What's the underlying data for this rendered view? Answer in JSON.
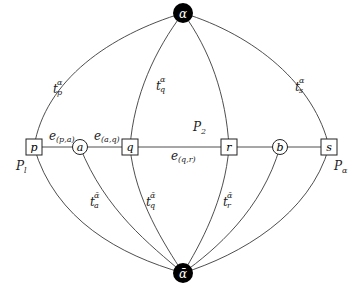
{
  "diagram": {
    "colors": {
      "line": "#3a3a3a",
      "terminal_fill": "#000000",
      "terminal_text": "#ffffff",
      "node_fill": "#ffffff"
    },
    "terminals": [
      {
        "id": "alpha",
        "label": "α",
        "shape": "filled-circle",
        "position": "top"
      },
      {
        "id": "alpha_bar",
        "label": "ᾱ",
        "shape": "filled-circle",
        "position": "bottom"
      }
    ],
    "nodes": [
      {
        "id": "p",
        "label": "p",
        "shape": "square"
      },
      {
        "id": "a",
        "label": "a",
        "shape": "circle"
      },
      {
        "id": "q",
        "label": "q",
        "shape": "square"
      },
      {
        "id": "r",
        "label": "r",
        "shape": "square"
      },
      {
        "id": "b",
        "label": "b",
        "shape": "circle"
      },
      {
        "id": "s",
        "label": "s",
        "shape": "square"
      }
    ],
    "edge_labels": {
      "e_pa": {
        "base": "e",
        "sub": "(p,a)"
      },
      "e_aq": {
        "base": "e",
        "sub": "(a,q)"
      },
      "e_qr": {
        "base": "e",
        "sub": "(q,r)"
      }
    },
    "terminal_edge_labels": {
      "t_p_alpha": {
        "base": "t",
        "sub": "p",
        "sup": "α"
      },
      "t_q_alpha": {
        "base": "t",
        "sub": "q",
        "sup": "α"
      },
      "t_s_alpha": {
        "base": "t",
        "sub": "s",
        "sup": "α"
      },
      "t_a_alphabar": {
        "base": "t",
        "sub": "a",
        "sup": "ᾱ"
      },
      "t_q_alphabar": {
        "base": "t",
        "sub": "q",
        "sup": "ᾱ"
      },
      "t_r_alphabar": {
        "base": "t",
        "sub": "r",
        "sup": "ᾱ"
      }
    },
    "region_labels": {
      "P_l": {
        "base": "P",
        "sub": "l"
      },
      "P_2": {
        "base": "P",
        "sub": "2"
      },
      "P_alpha": {
        "base": "P",
        "sub": "α"
      }
    }
  }
}
